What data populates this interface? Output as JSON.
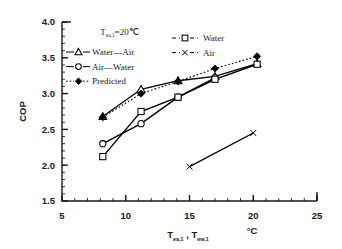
{
  "chart_data": {
    "type": "line",
    "title": "",
    "xlabel": "T(ea,1) , T(ew,1)",
    "xlabel_parts": {
      "t1_base": "T",
      "t1_sub": "ea,1",
      "separator": ",",
      "t2_base": "T",
      "t2_sub": "ew,1",
      "unit": "°C"
    },
    "ylabel": "COP",
    "xlim": [
      5,
      25
    ],
    "ylim": [
      1.5,
      4.0
    ],
    "xticks": [
      5,
      10,
      15,
      20,
      25
    ],
    "xticklabels": [
      "5",
      "10",
      "15",
      "20",
      "25"
    ],
    "yticks": [
      1.5,
      2.0,
      2.5,
      3.0,
      3.5,
      4.0
    ],
    "yticklabels": [
      "1.5",
      "2.0",
      "2.5",
      "3.0",
      "3.5",
      "4.0"
    ],
    "x_minor_step": 1,
    "y_minor_step": 0.1,
    "grid": false,
    "annotations": [
      {
        "name": "inlet-temp-annotation",
        "text": "T(ea,1)=20℃",
        "base": "T",
        "sub": "ea,1",
        "value": "=20℃",
        "x": 8.0,
        "y": 3.82
      }
    ],
    "legend_position": "upper-left-and-upper-center",
    "series": [
      {
        "name": "Water—Air",
        "label": "Water—Air",
        "marker": "open-triangle",
        "line": "solid",
        "color": "#000000",
        "x": [
          8.2,
          11.2,
          14.1,
          17.0,
          20.3
        ],
        "y": [
          2.68,
          3.06,
          3.18,
          3.24,
          3.42
        ]
      },
      {
        "name": "Air—Water",
        "label": "Air—Water",
        "marker": "open-circle",
        "line": "solid",
        "color": "#000000",
        "x": [
          8.2,
          11.2,
          14.1,
          17.0
        ],
        "y": [
          2.3,
          2.58,
          2.95,
          3.22
        ]
      },
      {
        "name": "Predicted",
        "label": "Predicted",
        "marker": "filled-diamond",
        "line": "dotted",
        "color": "#000000",
        "x": [
          8.2,
          11.2,
          14.1,
          17.0,
          20.3
        ],
        "y": [
          2.67,
          3.0,
          3.17,
          3.35,
          3.52
        ]
      },
      {
        "name": "Water",
        "label": "Water",
        "marker": "open-square",
        "line": "solid",
        "color": "#000000",
        "x": [
          8.2,
          11.2,
          14.1,
          17.0,
          20.3
        ],
        "y": [
          2.12,
          2.75,
          2.95,
          3.2,
          3.41
        ]
      },
      {
        "name": "Air",
        "label": "Air",
        "marker": "cross-x",
        "line": "solid",
        "color": "#000000",
        "x": [
          15.0,
          20.0
        ],
        "y": [
          1.98,
          2.45
        ]
      }
    ],
    "legend_left": [
      {
        "label": "Water—Air",
        "marker": "open-triangle",
        "line": "solid"
      },
      {
        "label": "Air—Water",
        "marker": "open-circle",
        "line": "solid"
      },
      {
        "label": "Predicted",
        "marker": "filled-diamond",
        "line": "dotted"
      }
    ],
    "legend_right": [
      {
        "label": "Water",
        "marker": "open-square",
        "line": "dashed"
      },
      {
        "label": "Air",
        "marker": "cross-x",
        "line": "dashed"
      }
    ]
  },
  "colors": {
    "axis": "#1a1a1a",
    "ink": "#000000",
    "background": "#ffffff"
  }
}
